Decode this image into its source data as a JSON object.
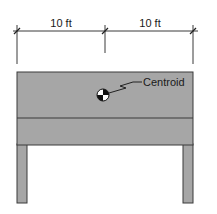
{
  "diagram": {
    "dimensions": [
      {
        "label": "10 ft"
      },
      {
        "label": "10 ft"
      }
    ],
    "centroid_label": "Centroid",
    "colors": {
      "fill": "#a6a6a6",
      "stroke": "#3a3a3a",
      "background": "#ffffff"
    }
  }
}
